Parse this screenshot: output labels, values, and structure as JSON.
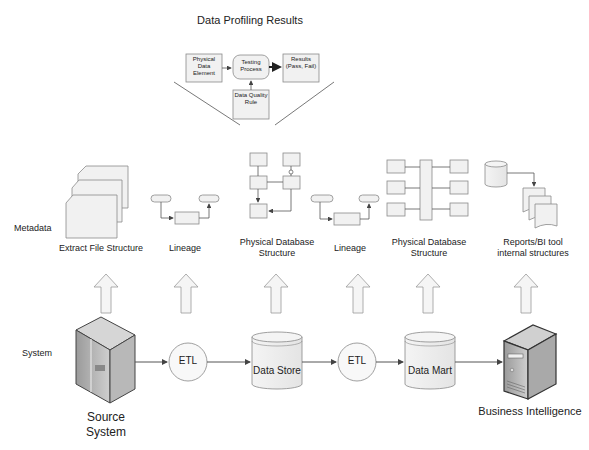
{
  "title": "Data Profiling Results",
  "profiling": {
    "physical_data_element": "Physical Data Element",
    "testing_process": "Testing Process",
    "results": "Results (Pass, Fail)",
    "data_quality_rule": "Data Quality Rule"
  },
  "rows": {
    "metadata": "Metadata",
    "system": "System"
  },
  "metadata_items": [
    {
      "label": "Extract File Structure",
      "icon": "stacked-documents-icon"
    },
    {
      "label": "Lineage",
      "icon": "lineage-flow-icon"
    },
    {
      "label": "Physical Database Structure",
      "icon": "er-diagram-icon"
    },
    {
      "label": "Lineage",
      "icon": "lineage-flow-icon"
    },
    {
      "label": "Physical Database Structure",
      "icon": "star-schema-icon"
    },
    {
      "label": "Reports/BI tool internal structures",
      "icon": "database-reports-icon"
    }
  ],
  "system_items": [
    {
      "label": "Source System",
      "icon": "mainframe-server-icon"
    },
    {
      "label": "ETL",
      "icon": "circle-process-icon"
    },
    {
      "label": "Data Store",
      "icon": "cylinder-database-icon"
    },
    {
      "label": "ETL",
      "icon": "circle-process-icon"
    },
    {
      "label": "Data Mart",
      "icon": "cylinder-database-icon"
    },
    {
      "label": "Business Intelligence",
      "icon": "tower-server-icon"
    }
  ]
}
